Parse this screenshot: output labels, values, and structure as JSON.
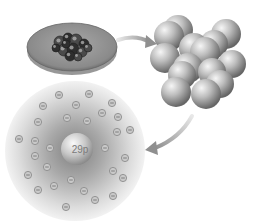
{
  "diagram": {
    "stages": [
      {
        "id": "sample",
        "label": "copper sample on dish"
      },
      {
        "id": "lattice",
        "label": "lattice of atoms"
      },
      {
        "id": "atom",
        "label": "single atom"
      }
    ],
    "nucleus": {
      "label": "29p",
      "protons": 29
    },
    "electron": {
      "symbol": "⊖",
      "count": 29
    },
    "arrows": [
      {
        "from": "sample",
        "to": "lattice"
      },
      {
        "from": "lattice",
        "to": "atom"
      }
    ],
    "colors": {
      "sphere_light": "#f2f2f2",
      "sphere_dark": "#6e6e6e",
      "cloud_dark": "#8a8a8a",
      "cloud_light": "#f4f4f4",
      "dish": "#8f8f8f",
      "arrow": "#a8a8a8"
    }
  }
}
